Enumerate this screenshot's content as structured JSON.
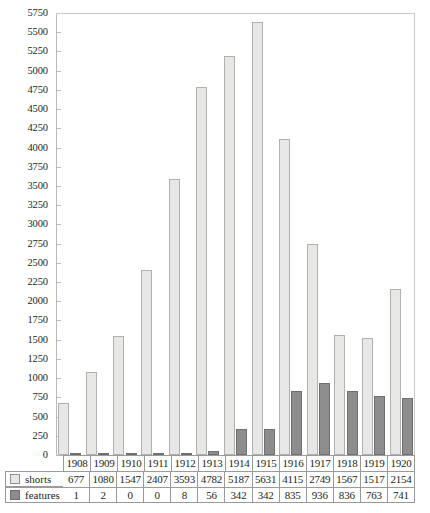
{
  "chart_data": {
    "type": "bar",
    "title": "",
    "xlabel": "",
    "ylabel": "",
    "ylim": [
      0,
      5750
    ],
    "ytick_step": 250,
    "grid": false,
    "legend_position": "table-left",
    "categories": [
      "1908",
      "1909",
      "1910",
      "1911",
      "1912",
      "1913",
      "1914",
      "1915",
      "1916",
      "1917",
      "1918",
      "1919",
      "1920"
    ],
    "yticks": [
      "5750",
      "5500",
      "5250",
      "5000",
      "4750",
      "4500",
      "4250",
      "4000",
      "3750",
      "3500",
      "3250",
      "3000",
      "2750",
      "2500",
      "2250",
      "2000",
      "1750",
      "1500",
      "1250",
      "1000",
      "750",
      "500",
      "250",
      "0"
    ],
    "series": [
      {
        "name": "shorts",
        "color": "#e7e7e5",
        "values": [
          677,
          1080,
          1547,
          2407,
          3593,
          4782,
          5187,
          5631,
          4115,
          2749,
          1567,
          1517,
          2154
        ]
      },
      {
        "name": "features",
        "color": "#8d8d8d",
        "values": [
          1,
          2,
          0,
          0,
          8,
          56,
          342,
          342,
          835,
          936,
          836,
          763,
          741
        ]
      }
    ]
  },
  "table": {
    "year_header": [
      "1908",
      "1909",
      "1910",
      "1911",
      "1912",
      "1913",
      "1914",
      "1915",
      "1916",
      "1917",
      "1918",
      "1919",
      "1920"
    ],
    "rows": [
      {
        "label": "shorts",
        "swatch": "shorts-swatch",
        "values": [
          "677",
          "1080",
          "1547",
          "2407",
          "3593",
          "4782",
          "5187",
          "5631",
          "4115",
          "2749",
          "1567",
          "1517",
          "2154"
        ]
      },
      {
        "label": "features",
        "swatch": "features-swatch",
        "values": [
          "1",
          "2",
          "0",
          "0",
          "8",
          "56",
          "342",
          "342",
          "835",
          "936",
          "836",
          "763",
          "741"
        ]
      }
    ]
  }
}
